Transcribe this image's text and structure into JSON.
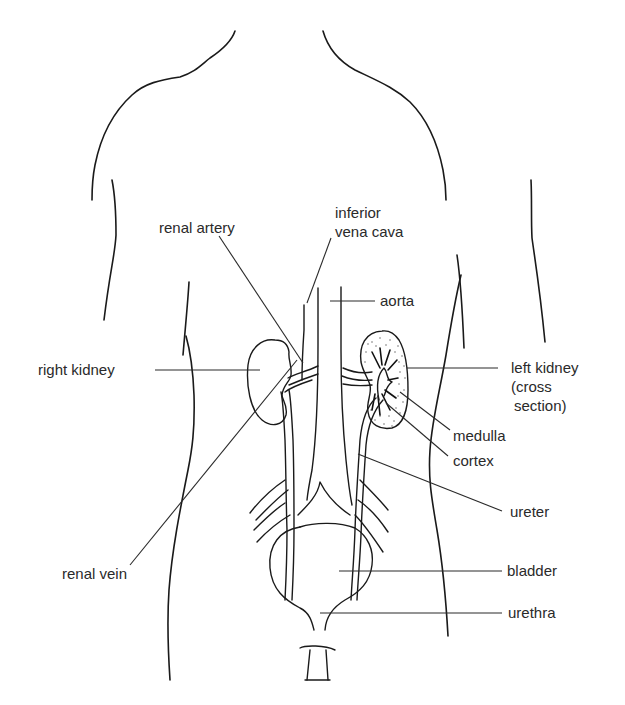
{
  "diagram": {
    "labels": {
      "renal_artery": "renal artery",
      "inferior_vena_cava_line1": "inferior",
      "inferior_vena_cava_line2": "vena cava",
      "aorta": "aorta",
      "right_kidney": "right kidney",
      "left_kidney_line1": "left kidney",
      "left_kidney_line2": "(cross",
      "left_kidney_line3": "section)",
      "medulla": "medulla",
      "cortex": "cortex",
      "ureter": "ureter",
      "renal_vein": "renal vein",
      "bladder": "bladder",
      "urethra": "urethra"
    },
    "colors": {
      "line": "#1a1a1a",
      "text": "#2a2a2a",
      "background": "#ffffff"
    }
  }
}
